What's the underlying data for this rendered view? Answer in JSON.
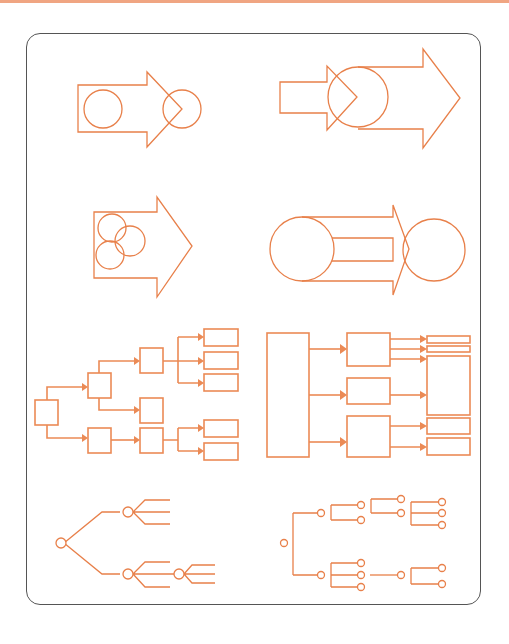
{
  "page": {
    "accent_color": "#e8804a",
    "frame_color": "#555555",
    "top_band_color": "#f0a582"
  },
  "diagrams": [
    {
      "id": "arrow-circle-in-body-and-at-tip",
      "description": "Block arrow with one circle inside the shaft and one circle straddling the tip"
    },
    {
      "id": "small-arrow-into-circle-into-big-arrow",
      "description": "Small block arrow pointing into a circle that feeds a larger block arrow"
    },
    {
      "id": "arrow-with-three-overlapping-circles",
      "description": "Block arrow containing three overlapping circles"
    },
    {
      "id": "circle-to-circle-split-arrow",
      "description": "Large circle connected to a second circle by a split (two-lane) block arrow"
    },
    {
      "id": "box-tree-left",
      "description": "Hierarchical box tree with arrow connectors, branching from a single root box",
      "nodes": 11
    },
    {
      "id": "box-flow-right",
      "description": "Tall source box feeding three middle boxes which feed five output boxes",
      "nodes": 9
    },
    {
      "id": "node-tree-left",
      "description": "Circle-node tree with fan-out lines"
    },
    {
      "id": "node-tree-right",
      "description": "Circle-node bracket tree with orthogonal connectors"
    }
  ]
}
